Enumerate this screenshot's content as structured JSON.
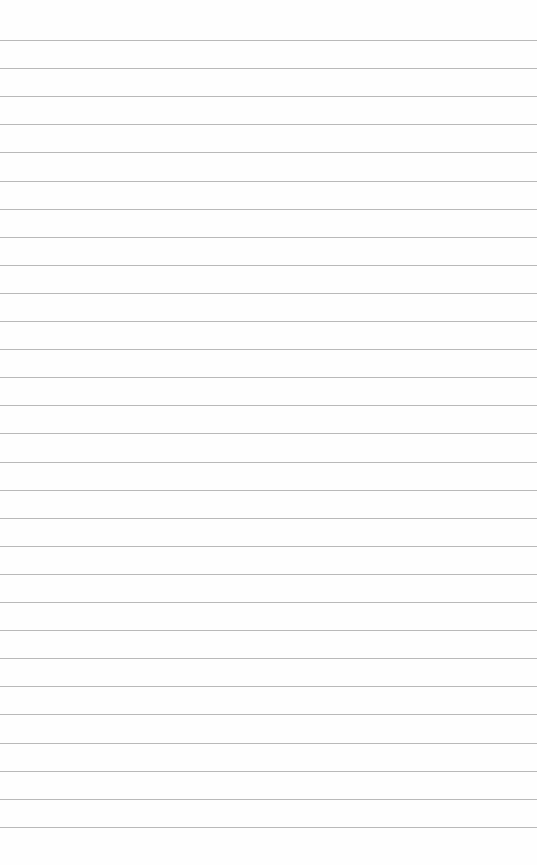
{
  "paper": {
    "type": "lined-paper",
    "line_count": 29,
    "first_line_y": 40,
    "line_spacing": 28.1,
    "line_color": "#b9b9b9",
    "background_color": "#fefefe"
  }
}
